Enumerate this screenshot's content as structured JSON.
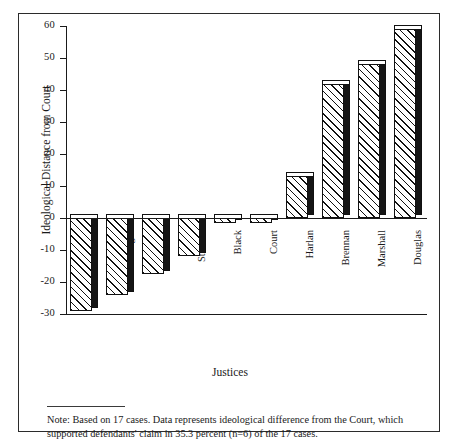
{
  "figure": {
    "note_label": "Note:",
    "note_text": "Note: Based on 17 cases. Data represents ideological difference from the Court, which supported defendants' claim in 35.3 percent (n=6) of the 17 cases."
  },
  "chart_data": {
    "type": "bar",
    "title": "",
    "xlabel": "Justices",
    "ylabel": "Ideological Distance from Court",
    "categories": [
      "Blackmun",
      "Burger",
      "White",
      "Stewart",
      "Black",
      "Court",
      "Harlan",
      "Brennan",
      "Marshall",
      "Douglas"
    ],
    "values": [
      -29,
      -24,
      -17.5,
      -12,
      0,
      0,
      13,
      42,
      48,
      59
    ],
    "ylim": [
      -30,
      60
    ],
    "yticks": [
      60,
      50,
      40,
      30,
      20,
      10,
      0,
      -10,
      -20,
      -30
    ],
    "ytick_labels": [
      "60",
      "50",
      "40",
      "30",
      "20",
      "10",
      "0",
      "-10",
      "-20",
      "-30"
    ],
    "grid": false,
    "legend": "none",
    "orientation": "vertical",
    "bar_style": "hatched-3d",
    "colors": {
      "bar_fill": "#ffffff",
      "bar_hatch": "#111111",
      "bar_shadow": "#151515",
      "axis": "#1a1a1a",
      "frame": "#2b2b2b",
      "background": "#ffffff"
    }
  }
}
